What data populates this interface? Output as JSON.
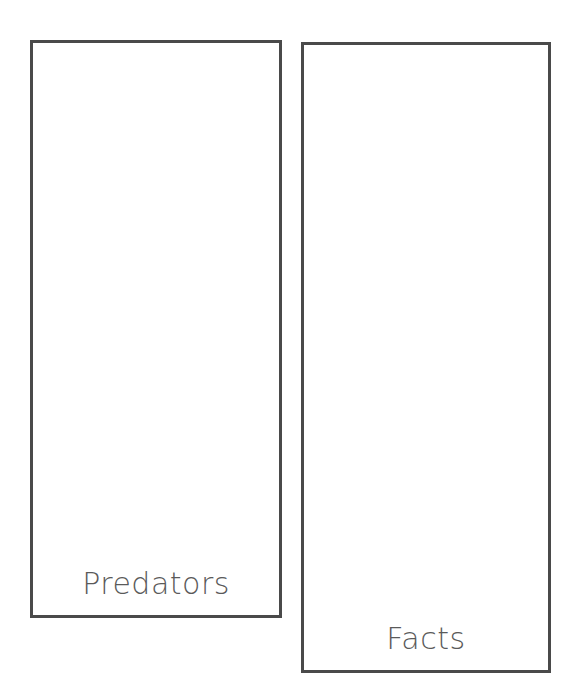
{
  "panels": [
    {
      "label": "Predators"
    },
    {
      "label": "Facts"
    }
  ],
  "colors": {
    "border": "#4a4a4a",
    "text": "#5a5a5a",
    "background": "#ffffff"
  }
}
